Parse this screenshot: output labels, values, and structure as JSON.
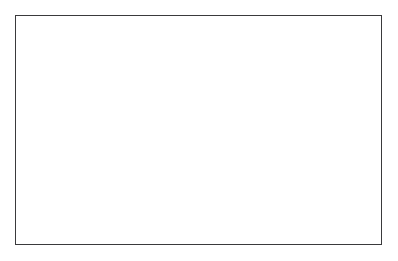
{
  "figure": {
    "kind": "dna-replication-diagram",
    "title_visible": false,
    "background_color": "#ffffff",
    "frame": {
      "visible": true,
      "border_color": "#3a3a3c",
      "border_width_px": 1.4,
      "x": 15,
      "y": 15,
      "width": 367,
      "height": 230
    },
    "palette": {
      "ribbon_dark": "#6f6f72",
      "ribbon_dark_edge": "#2f2f31",
      "ribbon_light": "#ffffff",
      "ribbon_light_edge": "#2f2f31",
      "base_rung": "#3a3a3c",
      "text": "#1b1b1b",
      "text_on_dark": "#ffffff"
    }
  },
  "labels": [
    {
      "id": "label-unwound-double-helix",
      "text": "Unwound double helix",
      "x": 80,
      "y": 42,
      "anchor": "start",
      "leader": {
        "style": "squiggle",
        "from_x": 128,
        "from_y": 46,
        "to_x": 158,
        "to_y": 73
      }
    },
    {
      "id": "label-new-nucleic-acid-strand",
      "text": "New nucleic acid strand",
      "x": 136,
      "y": 226,
      "anchor": "start",
      "leader": {
        "style": "squiggle",
        "from_x": 188,
        "from_y": 221,
        "to_x": 172,
        "to_y": 196
      }
    }
  ],
  "helices": {
    "parent_left": {
      "name": "parent-duplex-left",
      "description": "Intact double helix at left, two full turns",
      "x_start": 20,
      "x_end": 142,
      "center_y": 122,
      "turns": 2,
      "base_pairs": [
        {
          "top": "T",
          "bottom": "A"
        },
        {
          "top": "A",
          "bottom": "T"
        },
        {
          "top": "C",
          "bottom": "G"
        },
        {
          "top": "G",
          "bottom": "C"
        },
        {
          "top": "A",
          "bottom": "T"
        },
        {
          "top": "C",
          "bottom": "G"
        }
      ]
    },
    "fork": {
      "name": "replication-fork",
      "description": "Unwound region where the two parent strands separate",
      "x_start": 142,
      "x_end": 200,
      "upper_unpaired_bases": [
        "A",
        "C",
        "A",
        "T"
      ],
      "lower_unpaired_bases": [
        "A",
        "G",
        "T",
        "A"
      ]
    },
    "daughter_top": {
      "name": "daughter-duplex-top",
      "description": "Newly synthesized duplex, upper branch",
      "x_start": 196,
      "x_end": 372,
      "center_y": 70,
      "turns": 3,
      "base_pairs": [
        {
          "top": "G",
          "bottom": "C"
        },
        {
          "top": "T",
          "bottom": "A"
        },
        {
          "top": "G",
          "bottom": "C"
        },
        {
          "top": "T",
          "bottom": "A"
        },
        {
          "top": "C",
          "bottom": "G"
        },
        {
          "top": "A",
          "bottom": "T"
        },
        {
          "top": "G",
          "bottom": "C"
        }
      ]
    },
    "daughter_bottom": {
      "name": "daughter-duplex-bottom",
      "description": "Newly synthesized duplex, lower branch",
      "x_start": 196,
      "x_end": 372,
      "center_y": 165,
      "turns": 3,
      "base_pairs": [
        {
          "top": "G",
          "bottom": "C"
        },
        {
          "top": "T",
          "bottom": "A"
        },
        {
          "top": "G",
          "bottom": "C"
        },
        {
          "top": "T",
          "bottom": "A"
        },
        {
          "top": "C",
          "bottom": "G"
        },
        {
          "top": "A",
          "bottom": "T"
        },
        {
          "top": "G",
          "bottom": "C"
        }
      ]
    }
  },
  "nucleotide_letters": {
    "adenine": "A",
    "thymine": "T",
    "cytosine": "C",
    "guanine": "G"
  },
  "letter_placements": {
    "parent_left": [
      {
        "ch": "T",
        "x": 57,
        "y": 104,
        "on": "dark"
      },
      {
        "ch": "A",
        "x": 50,
        "y": 118,
        "on": "dark"
      },
      {
        "ch": "C",
        "x": 72,
        "y": 118,
        "on": "light"
      },
      {
        "ch": "C",
        "x": 44,
        "y": 132,
        "on": "dark"
      },
      {
        "ch": "T",
        "x": 58,
        "y": 140,
        "on": "dark"
      },
      {
        "ch": "A",
        "x": 67,
        "y": 133,
        "on": "light"
      },
      {
        "ch": "C",
        "x": 101,
        "y": 104,
        "on": "dark"
      },
      {
        "ch": "G",
        "x": 94,
        "y": 118,
        "on": "dark"
      },
      {
        "ch": "G",
        "x": 116,
        "y": 118,
        "on": "light"
      },
      {
        "ch": "A",
        "x": 89,
        "y": 132,
        "on": "dark"
      },
      {
        "ch": "C",
        "x": 103,
        "y": 140,
        "on": "dark"
      },
      {
        "ch": "A",
        "x": 111,
        "y": 133,
        "on": "light"
      }
    ],
    "fork_upper": [
      {
        "ch": "A",
        "x": 163,
        "y": 71,
        "on": "light"
      },
      {
        "ch": "C",
        "x": 176,
        "y": 62,
        "on": "light"
      },
      {
        "ch": "A",
        "x": 190,
        "y": 70,
        "on": "light"
      },
      {
        "ch": "T",
        "x": 152,
        "y": 87,
        "on": "dark"
      },
      {
        "ch": "C",
        "x": 147,
        "y": 105,
        "on": "dark"
      },
      {
        "ch": "A",
        "x": 151,
        "y": 122,
        "on": "dark"
      }
    ],
    "fork_lower": [
      {
        "ch": "A",
        "x": 160,
        "y": 150,
        "on": "light"
      },
      {
        "ch": "T",
        "x": 170,
        "y": 165,
        "on": "light"
      },
      {
        "ch": "G",
        "x": 183,
        "y": 180,
        "on": "light"
      },
      {
        "ch": "T",
        "x": 196,
        "y": 186,
        "on": "light"
      },
      {
        "ch": "A",
        "x": 209,
        "y": 180,
        "on": "light"
      }
    ],
    "daughter_top": [
      {
        "ch": "G",
        "x": 224,
        "y": 68,
        "on": "dark"
      },
      {
        "ch": "T",
        "x": 241,
        "y": 58,
        "on": "light"
      },
      {
        "ch": "C",
        "x": 228,
        "y": 86,
        "on": "dark"
      },
      {
        "ch": "A",
        "x": 247,
        "y": 83,
        "on": "light"
      },
      {
        "ch": "T",
        "x": 213,
        "y": 82,
        "on": "dark"
      },
      {
        "ch": "G",
        "x": 272,
        "y": 62,
        "on": "dark"
      },
      {
        "ch": "A",
        "x": 292,
        "y": 58,
        "on": "light"
      },
      {
        "ch": "A",
        "x": 277,
        "y": 86,
        "on": "dark"
      },
      {
        "ch": "G",
        "x": 297,
        "y": 83,
        "on": "light"
      },
      {
        "ch": "C",
        "x": 322,
        "y": 64,
        "on": "dark"
      },
      {
        "ch": "A",
        "x": 341,
        "y": 57,
        "on": "light"
      },
      {
        "ch": "G",
        "x": 327,
        "y": 86,
        "on": "dark"
      },
      {
        "ch": "T",
        "x": 346,
        "y": 80,
        "on": "light"
      }
    ],
    "daughter_bottom": [
      {
        "ch": "G",
        "x": 224,
        "y": 163,
        "on": "dark"
      },
      {
        "ch": "T",
        "x": 241,
        "y": 153,
        "on": "light"
      },
      {
        "ch": "C",
        "x": 228,
        "y": 181,
        "on": "dark"
      },
      {
        "ch": "A",
        "x": 247,
        "y": 178,
        "on": "light"
      },
      {
        "ch": "T",
        "x": 213,
        "y": 177,
        "on": "dark"
      },
      {
        "ch": "G",
        "x": 272,
        "y": 157,
        "on": "dark"
      },
      {
        "ch": "A",
        "x": 292,
        "y": 153,
        "on": "light"
      },
      {
        "ch": "A",
        "x": 277,
        "y": 181,
        "on": "dark"
      },
      {
        "ch": "G",
        "x": 297,
        "y": 178,
        "on": "light"
      },
      {
        "ch": "C",
        "x": 322,
        "y": 159,
        "on": "dark"
      },
      {
        "ch": "A",
        "x": 341,
        "y": 152,
        "on": "light"
      },
      {
        "ch": "G",
        "x": 327,
        "y": 181,
        "on": "dark"
      },
      {
        "ch": "T",
        "x": 346,
        "y": 175,
        "on": "light"
      }
    ]
  }
}
